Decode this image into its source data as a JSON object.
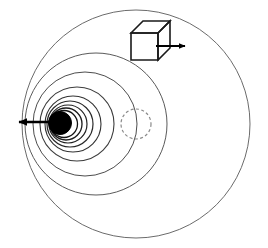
{
  "figure": {
    "width": 268,
    "height": 248,
    "background_color": "#ffffff"
  },
  "colors": {
    "outline_light": "#6b6b6b",
    "outline_mid": "#444444",
    "outline_dark": "#1a1a1a",
    "black_fill": "#000000",
    "dashed_gray": "#8a8a8a",
    "background": "#ffffff"
  },
  "chart_data": {
    "type": "diagram",
    "xlim": [
      0,
      268
    ],
    "ylim": [
      0,
      248
    ],
    "grid": false,
    "legend": null,
    "elements": [
      {
        "id": "outer-circle",
        "name": "outer-circle",
        "type": "circle",
        "cx": 136,
        "cy": 124,
        "r": 114,
        "stroke": "#6b6b6b",
        "stroke_width": 1.0,
        "fill": "none",
        "dashed": false
      },
      {
        "id": "ring-2",
        "name": "nested-circle-2",
        "type": "circle",
        "cx": 96,
        "cy": 124,
        "r": 71,
        "stroke": "#5a5a5a",
        "stroke_width": 1.0,
        "fill": "none",
        "dashed": false
      },
      {
        "id": "ring-3",
        "name": "nested-circle-3",
        "type": "circle",
        "cx": 85,
        "cy": 124,
        "r": 52,
        "stroke": "#4d4d4d",
        "stroke_width": 1.0,
        "fill": "none",
        "dashed": false
      },
      {
        "id": "ring-4",
        "name": "nested-circle-4",
        "type": "circle",
        "cx": 77,
        "cy": 124,
        "r": 37,
        "stroke": "#3d3d3d",
        "stroke_width": 1.1,
        "fill": "none",
        "dashed": false
      },
      {
        "id": "ring-5",
        "name": "nested-circle-5",
        "type": "circle",
        "cx": 73,
        "cy": 124,
        "r": 28,
        "stroke": "#333333",
        "stroke_width": 1.1,
        "fill": "none",
        "dashed": false
      },
      {
        "id": "ring-6",
        "name": "nested-circle-6",
        "type": "circle",
        "cx": 70,
        "cy": 124,
        "r": 23,
        "stroke": "#2a2a2a",
        "stroke_width": 1.2,
        "fill": "none",
        "dashed": false
      },
      {
        "id": "ring-7",
        "name": "nested-circle-7",
        "type": "circle",
        "cx": 68,
        "cy": 124,
        "r": 19,
        "stroke": "#222222",
        "stroke_width": 1.2,
        "fill": "none",
        "dashed": false
      },
      {
        "id": "ring-8",
        "name": "nested-circle-8",
        "type": "circle",
        "cx": 66,
        "cy": 124,
        "r": 16,
        "stroke": "#1a1a1a",
        "stroke_width": 1.3,
        "fill": "none",
        "dashed": false
      },
      {
        "id": "ring-9",
        "name": "nested-circle-9",
        "type": "circle",
        "cx": 64,
        "cy": 124,
        "r": 13.5,
        "stroke": "#141414",
        "stroke_width": 1.3,
        "fill": "none",
        "dashed": false
      },
      {
        "id": "black-disc",
        "name": "black-disc",
        "type": "circle",
        "cx": 60,
        "cy": 123,
        "r": 11.5,
        "stroke": "#000000",
        "stroke_width": 1.0,
        "fill": "#000000",
        "dashed": false
      },
      {
        "id": "dashed-circle",
        "name": "dashed-circle",
        "type": "circle",
        "cx": 136,
        "cy": 124,
        "r": 15,
        "stroke": "#8a8a8a",
        "stroke_width": 1.2,
        "fill": "none",
        "dashed": true,
        "dash_pattern": "3 2.4"
      },
      {
        "id": "cube",
        "name": "cube-glyph",
        "type": "cube",
        "front_face": {
          "x": 131,
          "y": 33,
          "width": 27,
          "height": 27
        },
        "depth_offset": {
          "dx": 12,
          "dy": -12
        },
        "stroke": "#1a1a1a",
        "stroke_width": 1.6,
        "fill": "none"
      },
      {
        "id": "cube-arrow",
        "name": "cube-arrow",
        "type": "arrow",
        "x1": 156,
        "y1": 46,
        "x2": 188,
        "y2": 46,
        "direction": "right",
        "stroke": "#000000",
        "stroke_width": 2.0
      },
      {
        "id": "disc-arrow",
        "name": "disc-arrow",
        "type": "arrow",
        "x1": 62,
        "y1": 122,
        "x2": 12,
        "y2": 122,
        "direction": "left",
        "stroke": "#000000",
        "stroke_width": 2.4
      }
    ]
  }
}
